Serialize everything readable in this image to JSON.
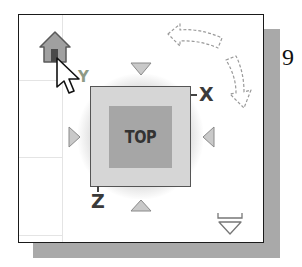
{
  "viewcube": {
    "face_label": "TOP",
    "axes": {
      "x": "X",
      "y": "Y",
      "z": "Z"
    }
  },
  "page": {
    "number": "9"
  },
  "icons": {
    "home": "home-icon",
    "cursor": "mouse-pointer-icon",
    "rotate_ccw": "rotate-counterclockwise-arrow-icon",
    "rotate_cw": "rotate-clockwise-arrow-icon",
    "menu": "viewcube-menu-dropdown-icon",
    "nav_up": "triangle-down-arrow-icon",
    "nav_down": "triangle-up-arrow-icon",
    "nav_left": "triangle-right-arrow-icon",
    "nav_right": "triangle-left-arrow-icon"
  },
  "colors": {
    "panel_border": "#1a1a1a",
    "shadow": "#a9a9a9",
    "cube_outer": "#d6d6d6",
    "cube_face": "#a6a6a6",
    "home_fill": "#a0a0a0",
    "arrow_triangle": "#c4c4c4"
  }
}
